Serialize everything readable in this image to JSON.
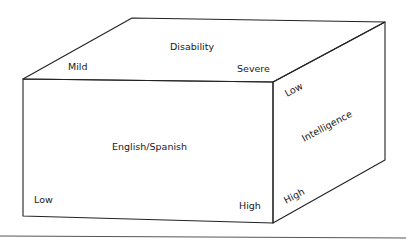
{
  "diagram": {
    "type": "3d-cube-classification",
    "top_face": {
      "axis_title": "Disability",
      "low_end": "Mild",
      "high_end": "Severe"
    },
    "front_face": {
      "axis_title": "English/Spanish",
      "low_end": "Low",
      "high_end": "High"
    },
    "right_face": {
      "axis_title": "Intelligence",
      "low_end": "Low",
      "high_end": "High"
    }
  }
}
